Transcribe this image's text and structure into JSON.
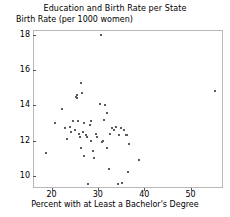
{
  "chart_data": {
    "type": "scatter",
    "title": "Education and Birth Rate per State",
    "ylabel": "Birth Rate (per 1000 women)",
    "xlabel": "Percent with at Least a Bachelor's Degree",
    "xlim": [
      16,
      57
    ],
    "ylim": [
      9.3,
      18.3
    ],
    "xticks": [
      20,
      30,
      40,
      50
    ],
    "yticks": [
      10,
      12,
      14,
      16,
      18
    ],
    "grid": false,
    "legend": null,
    "marker_color": "#5b5b5b",
    "points": [
      {
        "x": 18.9,
        "y": 11.3
      },
      {
        "x": 20.8,
        "y": 13.0
      },
      {
        "x": 22.3,
        "y": 13.8
      },
      {
        "x": 22.9,
        "y": 12.7
      },
      {
        "x": 23.4,
        "y": 12.1
      },
      {
        "x": 24.0,
        "y": 12.8
      },
      {
        "x": 24.3,
        "y": 12.5
      },
      {
        "x": 24.7,
        "y": 13.1
      },
      {
        "x": 25.0,
        "y": 12.6
      },
      {
        "x": 25.3,
        "y": 14.5
      },
      {
        "x": 25.5,
        "y": 14.4
      },
      {
        "x": 25.6,
        "y": 14.6
      },
      {
        "x": 25.8,
        "y": 13.1
      },
      {
        "x": 26.0,
        "y": 12.4
      },
      {
        "x": 26.1,
        "y": 12.2
      },
      {
        "x": 26.3,
        "y": 11.6
      },
      {
        "x": 26.4,
        "y": 15.3
      },
      {
        "x": 26.6,
        "y": 14.7
      },
      {
        "x": 26.8,
        "y": 12.5
      },
      {
        "x": 26.9,
        "y": 11.1
      },
      {
        "x": 27.1,
        "y": 13.0
      },
      {
        "x": 27.4,
        "y": 12.3
      },
      {
        "x": 27.6,
        "y": 12.2
      },
      {
        "x": 27.8,
        "y": 9.5
      },
      {
        "x": 28.2,
        "y": 12.9
      },
      {
        "x": 28.5,
        "y": 13.1
      },
      {
        "x": 28.6,
        "y": 12.0
      },
      {
        "x": 28.9,
        "y": 11.4
      },
      {
        "x": 29.1,
        "y": 11.0
      },
      {
        "x": 29.5,
        "y": 12.4
      },
      {
        "x": 29.8,
        "y": 12.2
      },
      {
        "x": 30.4,
        "y": 14.1
      },
      {
        "x": 30.6,
        "y": 18.0
      },
      {
        "x": 30.8,
        "y": 11.9
      },
      {
        "x": 31.0,
        "y": 12.0
      },
      {
        "x": 31.3,
        "y": 13.2
      },
      {
        "x": 31.6,
        "y": 14.0
      },
      {
        "x": 31.9,
        "y": 13.6
      },
      {
        "x": 32.0,
        "y": 11.6
      },
      {
        "x": 32.3,
        "y": 10.4
      },
      {
        "x": 32.6,
        "y": 12.4
      },
      {
        "x": 33.0,
        "y": 12.7
      },
      {
        "x": 33.5,
        "y": 12.6
      },
      {
        "x": 33.9,
        "y": 12.8
      },
      {
        "x": 34.3,
        "y": 9.5
      },
      {
        "x": 34.6,
        "y": 12.3
      },
      {
        "x": 35.0,
        "y": 12.7
      },
      {
        "x": 35.3,
        "y": 9.6
      },
      {
        "x": 35.6,
        "y": 12.6
      },
      {
        "x": 36.0,
        "y": 12.3
      },
      {
        "x": 36.3,
        "y": 12.3
      },
      {
        "x": 36.6,
        "y": 10.2
      },
      {
        "x": 36.8,
        "y": 11.8
      },
      {
        "x": 38.9,
        "y": 10.9
      },
      {
        "x": 55.3,
        "y": 14.8
      }
    ]
  }
}
